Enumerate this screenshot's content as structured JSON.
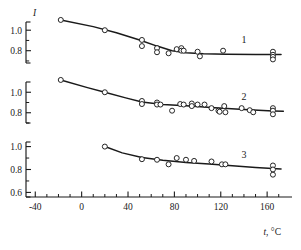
{
  "figure": {
    "kind": "scientific-plot",
    "background": "#ffffff",
    "ink_color": "#1a1a1a"
  },
  "chart_data": {
    "type": "scatter",
    "title": "",
    "subtitle": "",
    "xlabel": "t, °C",
    "ylabel": "I",
    "grid": false,
    "legend_position": "inline-right",
    "annotations": [
      "1",
      "2",
      "3"
    ],
    "xlim": [
      -48,
      178
    ],
    "xticks": [
      -40,
      0,
      40,
      80,
      120,
      160
    ],
    "xtick_labels": [
      "-40",
      "0",
      "40",
      "80",
      "120",
      "160"
    ],
    "xminor_step": 10,
    "panels": [
      {
        "id": "panel-1",
        "label": "1",
        "ylim": [
          0.68,
          1.08
        ],
        "yticks": [
          1.0,
          0.8
        ],
        "ytick_labels": [
          "1.0",
          "0.8"
        ],
        "yminor": [
          0.9,
          0.7
        ],
        "series": [
          {
            "name": "1",
            "points": [
              [
                -18,
                1.1
              ],
              [
                20,
                1.0
              ],
              [
                52,
                0.905
              ],
              [
                52,
                0.845
              ],
              [
                65,
                0.825
              ],
              [
                65,
                0.785
              ],
              [
                75,
                0.775
              ],
              [
                82,
                0.815
              ],
              [
                86,
                0.825
              ],
              [
                86,
                0.8
              ],
              [
                88,
                0.8
              ],
              [
                100,
                0.79
              ],
              [
                102,
                0.745
              ],
              [
                122,
                0.8
              ],
              [
                165,
                0.79
              ],
              [
                165,
                0.76
              ],
              [
                165,
                0.74
              ],
              [
                165,
                0.715
              ]
            ],
            "fit": [
              [
                -18,
                1.1
              ],
              [
                10,
                1.035
              ],
              [
                30,
                0.975
              ],
              [
                50,
                0.905
              ],
              [
                65,
                0.845
              ],
              [
                78,
                0.8
              ],
              [
                90,
                0.78
              ],
              [
                105,
                0.77
              ],
              [
                125,
                0.766
              ],
              [
                150,
                0.764
              ],
              [
                172,
                0.763
              ]
            ]
          }
        ]
      },
      {
        "id": "panel-2",
        "label": "2",
        "ylim": [
          0.7,
          1.1
        ],
        "yticks": [
          1.0,
          0.8
        ],
        "ytick_labels": [
          "1.0",
          "0.8"
        ],
        "yminor": [
          0.9,
          0.7
        ],
        "series": [
          {
            "name": "2",
            "points": [
              [
                -18,
                1.12
              ],
              [
                20,
                1.0
              ],
              [
                52,
                0.915
              ],
              [
                52,
                0.885
              ],
              [
                65,
                0.9
              ],
              [
                65,
                0.88
              ],
              [
                68,
                0.88
              ],
              [
                78,
                0.82
              ],
              [
                85,
                0.885
              ],
              [
                88,
                0.88
              ],
              [
                95,
                0.89
              ],
              [
                95,
                0.865
              ],
              [
                100,
                0.88
              ],
              [
                106,
                0.88
              ],
              [
                112,
                0.845
              ],
              [
                118,
                0.82
              ],
              [
                119,
                0.81
              ],
              [
                123,
                0.865
              ],
              [
                124,
                0.805
              ],
              [
                138,
                0.845
              ],
              [
                145,
                0.825
              ],
              [
                148,
                0.805
              ],
              [
                165,
                0.845
              ],
              [
                165,
                0.82
              ],
              [
                165,
                0.785
              ]
            ],
            "fit": [
              [
                -18,
                1.12
              ],
              [
                5,
                1.045
              ],
              [
                20,
                1.0
              ],
              [
                38,
                0.945
              ],
              [
                52,
                0.905
              ],
              [
                70,
                0.88
              ],
              [
                90,
                0.868
              ],
              [
                115,
                0.85
              ],
              [
                140,
                0.832
              ],
              [
                165,
                0.818
              ],
              [
                174,
                0.815
              ]
            ]
          }
        ]
      },
      {
        "id": "panel-3",
        "label": "3",
        "ylim": [
          0.56,
          1.04
        ],
        "yticks": [
          1.0,
          0.8,
          0.6
        ],
        "ytick_labels": [
          "1.0",
          "0.8",
          "0.6"
        ],
        "yminor": [
          0.9,
          0.7
        ],
        "series": [
          {
            "name": "3",
            "points": [
              [
                20,
                1.0
              ],
              [
                52,
                0.89
              ],
              [
                65,
                0.885
              ],
              [
                75,
                0.845
              ],
              [
                82,
                0.9
              ],
              [
                90,
                0.885
              ],
              [
                97,
                0.875
              ],
              [
                112,
                0.87
              ],
              [
                121,
                0.845
              ],
              [
                124,
                0.845
              ],
              [
                165,
                0.835
              ],
              [
                165,
                0.8
              ],
              [
                165,
                0.755
              ]
            ],
            "fit": [
              [
                20,
                1.0
              ],
              [
                35,
                0.945
              ],
              [
                52,
                0.905
              ],
              [
                70,
                0.88
              ],
              [
                90,
                0.862
              ],
              [
                110,
                0.848
              ],
              [
                130,
                0.832
              ],
              [
                150,
                0.818
              ],
              [
                172,
                0.805
              ]
            ]
          }
        ]
      }
    ]
  }
}
